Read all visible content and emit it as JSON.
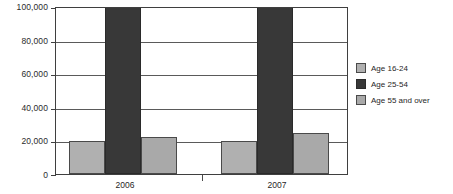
{
  "chart_data": {
    "type": "bar",
    "title": "",
    "subtitle": "",
    "xlabel": "",
    "ylabel": "",
    "categories": [
      "2006",
      "2007"
    ],
    "series": [
      {
        "name": "Age 16-24",
        "values": [
          20000,
          20000
        ],
        "color": "#b0b0b0"
      },
      {
        "name": "Age 25-54",
        "values": [
          100000,
          100000
        ],
        "color": "#383838",
        "clipped": true
      },
      {
        "name": "Age 55 and over",
        "values": [
          22500,
          25000
        ],
        "color": "#a9a9a9"
      }
    ],
    "ylim": [
      0,
      100000
    ],
    "yticks": [
      0,
      20000,
      40000,
      60000,
      80000,
      100000
    ],
    "ytick_labels": [
      "0",
      "20,000",
      "40,000",
      "60,000",
      "80,000",
      "100,000"
    ],
    "grid": true,
    "legend_position": "right",
    "bar_group_layout": "clustered-adjacent"
  },
  "axes": {
    "y_tick_labels": [
      "100,000",
      "80,000",
      "60,000",
      "40,000",
      "20,000",
      "0"
    ],
    "x_tick_labels": [
      "2006",
      "2007"
    ]
  },
  "legend": {
    "items": [
      {
        "label": "Age 16-24"
      },
      {
        "label": "Age 25-54"
      },
      {
        "label": "Age 55 and over"
      }
    ]
  }
}
